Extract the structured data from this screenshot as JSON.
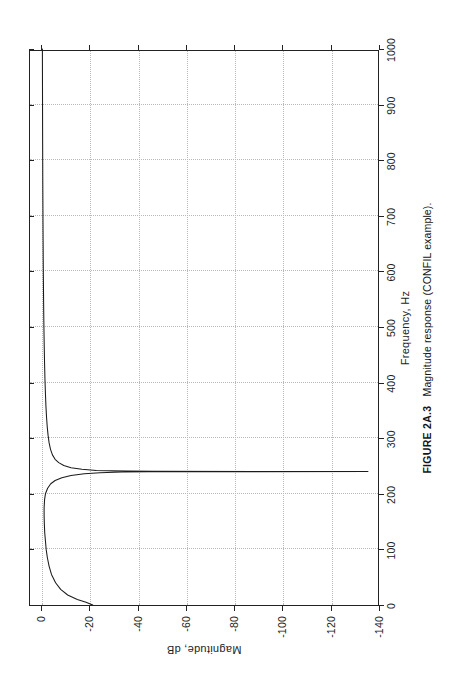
{
  "figure": {
    "caption_number": "FIGURE 2A.3",
    "caption_text": "Magnitude response (CONFIL example)."
  },
  "chart_data": {
    "type": "line",
    "title": "",
    "xlabel": "Frequency, Hz",
    "ylabel": "Magnitude, dB",
    "xlim": [
      0,
      1000
    ],
    "ylim": [
      -140,
      5
    ],
    "xticks": [
      0,
      100,
      200,
      300,
      400,
      500,
      600,
      700,
      800,
      900,
      1000
    ],
    "xticklabels": [
      "0",
      "100",
      "200",
      "300",
      "400",
      "500",
      "600",
      "700",
      "800",
      "900",
      "1000"
    ],
    "yticks": [
      0,
      -20,
      -40,
      -60,
      -80,
      -100,
      -120,
      -140
    ],
    "yticklabels": [
      "0",
      "-20",
      "-40",
      "-60",
      "-80",
      "-100",
      "-120",
      "-140"
    ],
    "grid": true,
    "grid_style": "dotted",
    "legend": null,
    "line_color": "#1b1b1b",
    "notch_frequency_hz": 240,
    "notch_depth_db": -135,
    "series": [
      {
        "name": "Magnitude response",
        "x": [
          0,
          5,
          10,
          18,
          28,
          40,
          55,
          70,
          85,
          100,
          115,
          130,
          145,
          160,
          175,
          190,
          200,
          210,
          218,
          224,
          229,
          233,
          236,
          238,
          239.2,
          239.7,
          240,
          240.3,
          240.8,
          242,
          244,
          247,
          251,
          256,
          262,
          270,
          280,
          292,
          305,
          320,
          338,
          358,
          380,
          405,
          432,
          460,
          490,
          520,
          552,
          585,
          620,
          655,
          690,
          725,
          760,
          795,
          830,
          865,
          900,
          935,
          970,
          1000
        ],
        "y": [
          -21.0,
          -18.2,
          -14.6,
          -10.6,
          -7.7,
          -5.6,
          -3.9,
          -2.9,
          -2.2,
          -1.7,
          -1.4,
          -1.1,
          -0.95,
          -0.85,
          -0.85,
          -1.05,
          -1.4,
          -2.3,
          -3.6,
          -5.4,
          -8.2,
          -12.0,
          -17.5,
          -24.0,
          -33.0,
          -44.0,
          -135.0,
          -46.0,
          -35.0,
          -22.5,
          -16.5,
          -12.0,
          -9.0,
          -6.9,
          -5.4,
          -4.3,
          -3.5,
          -2.9,
          -2.5,
          -2.15,
          -1.85,
          -1.6,
          -1.4,
          -1.2,
          -1.05,
          -0.92,
          -0.8,
          -0.7,
          -0.62,
          -0.55,
          -0.48,
          -0.43,
          -0.38,
          -0.34,
          -0.3,
          -0.27,
          -0.24,
          -0.21,
          -0.19,
          -0.17,
          -0.15,
          -0.13
        ]
      }
    ]
  }
}
